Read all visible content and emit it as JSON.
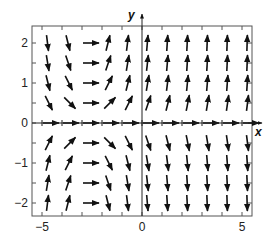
{
  "chart_data": {
    "type": "vector_field",
    "title": "",
    "xlabel": "x",
    "ylabel": "y",
    "xlim": [
      -5.5,
      5.5
    ],
    "ylim": [
      -2.35,
      2.4
    ],
    "x_ticks": [
      -5,
      -4,
      -3,
      -2,
      -1,
      0,
      1,
      2,
      3,
      4,
      5
    ],
    "x_tick_labels": [
      "-5",
      "",
      "",
      "",
      "",
      "0",
      "",
      "",
      "",
      "",
      "5"
    ],
    "y_ticks": [
      -2,
      -1.5,
      -1,
      -0.5,
      0,
      0.5,
      1,
      1.5,
      2
    ],
    "y_tick_labels": [
      "-2",
      "",
      "-1",
      "",
      "0",
      "",
      "1",
      "",
      "2"
    ],
    "grid": false,
    "field_description": "F(x,y) = (1, (x+3)y), arrows drawn with normalized length",
    "grid_x": [
      -5,
      -4,
      -3,
      -2,
      -1,
      0,
      1,
      2,
      3,
      4,
      5
    ],
    "grid_y": [
      -2,
      -1.5,
      -1,
      -0.5,
      0,
      0.5,
      1,
      1.5,
      2
    ],
    "colors": {
      "arrow": "#111111",
      "axis": "#222222",
      "frame": "#555555",
      "background": "#ffffff"
    }
  }
}
